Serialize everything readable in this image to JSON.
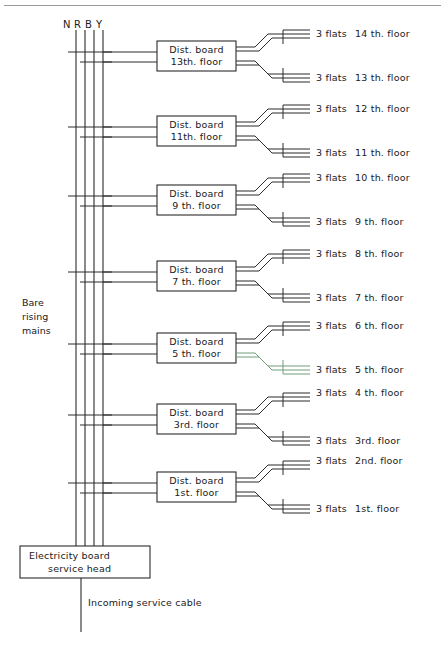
{
  "diagram": {
    "top_rule": true,
    "background_color": "#ffffff",
    "line_color": "#2b2b2b",
    "phase_labels": [
      "N",
      "R",
      "B",
      "Y"
    ],
    "rising_mains_label_lines": [
      "Bare",
      "rising",
      "mains"
    ],
    "service_head_label_lines": [
      "Electricity board",
      "service head"
    ],
    "incoming_cable_label": "Incoming service cable",
    "dist_boards": [
      {
        "line1": "Dist. board",
        "line2": "13th. floor"
      },
      {
        "line1": "Dist. board",
        "line2": "11th. floor"
      },
      {
        "line1": "Dist. board",
        "line2": "9 th. floor"
      },
      {
        "line1": "Dist. board",
        "line2": "7 th. floor"
      },
      {
        "line1": "Dist. board",
        "line2": "5 th. floor"
      },
      {
        "line1": "Dist. board",
        "line2": "3rd. floor"
      },
      {
        "line1": "Dist. board",
        "line2": "1st. floor"
      }
    ],
    "flat_feeds": [
      {
        "flats": "3 flats",
        "floor": "14 th. floor",
        "tint": "#2b2b2b"
      },
      {
        "flats": "3 flats",
        "floor": "13 th. floor",
        "tint": "#2b2b2b"
      },
      {
        "flats": "3 flats",
        "floor": "12 th. floor",
        "tint": "#2b2b2b"
      },
      {
        "flats": "3 flats",
        "floor": "11 th. floor",
        "tint": "#2b2b2b"
      },
      {
        "flats": "3 flats",
        "floor": "10 th. floor",
        "tint": "#2b2b2b"
      },
      {
        "flats": "3 flats",
        "floor": "9 th. floor",
        "tint": "#2b2b2b"
      },
      {
        "flats": "3 flats",
        "floor": "8 th. floor",
        "tint": "#2b2b2b"
      },
      {
        "flats": "3 flats",
        "floor": "7 th. floor",
        "tint": "#2b2b2b"
      },
      {
        "flats": "3 flats",
        "floor": "6 th. floor",
        "tint": "#2b2b2b"
      },
      {
        "flats": "3 flats",
        "floor": "5 th. floor",
        "tint": "#6f9e78"
      },
      {
        "flats": "3 flats",
        "floor": "4 th. floor",
        "tint": "#2b2b2b"
      },
      {
        "flats": "3 flats",
        "floor": "3rd. floor",
        "tint": "#2b2b2b"
      },
      {
        "flats": "3 flats",
        "floor": "2nd. floor",
        "tint": "#2b2b2b"
      },
      {
        "flats": "3 flats",
        "floor": "1st. floor",
        "tint": "#2b2b2b"
      }
    ]
  }
}
